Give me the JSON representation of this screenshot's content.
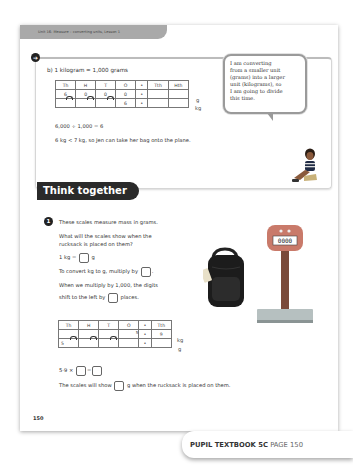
{
  "header": {
    "unit_label": "Unit 16: Measure – converting units, Lesson 1"
  },
  "part_b": {
    "icon": "arrow-icon",
    "title": "b)  1 kilogram = 1,000 grams",
    "table": {
      "headers": [
        "Th",
        "H",
        "T",
        "O",
        "•",
        "Tth",
        "Hth"
      ],
      "rows": [
        {
          "cells": [
            "6",
            "0",
            "0",
            "0",
            "•",
            "",
            ""
          ],
          "unit": "g"
        },
        {
          "cells": [
            "",
            "",
            "",
            "6",
            "•",
            "",
            ""
          ],
          "unit": "kg"
        }
      ]
    },
    "equation": "6,000 ÷ 1,000 = 6",
    "conclusion": "6 kg < 7 kg, so Jen can take her bag onto the plane."
  },
  "speech_bubble": {
    "lines": [
      "I am converting",
      "from a smaller unit",
      "(grams) into a larger",
      "unit (kilograms), so",
      "I am going to divide",
      "this time."
    ]
  },
  "think_together": {
    "heading": "Think together",
    "question_number": "1",
    "intro": "These scales measure mass in grams.",
    "question_line1": "What will the scales show when the",
    "question_line2": "rucksack is placed on them?",
    "kg_prefix": "1 kg =",
    "kg_suffix": "g",
    "convert_prefix": "To convert kg to g, multiply by",
    "convert_suffix": ".",
    "multiply_line1": "When we multiply by 1,000, the digits",
    "multiply_prefix": "shift to the left by",
    "multiply_suffix": "places.",
    "table": {
      "headers": [
        "Th",
        "H",
        "T",
        "O",
        "•",
        "Tth"
      ],
      "rows": [
        {
          "cells": [
            "",
            "",
            "",
            "5",
            "•",
            "9"
          ],
          "unit": "kg"
        },
        {
          "cells": [
            "5",
            "",
            "",
            "",
            "•",
            ""
          ],
          "unit": "g"
        }
      ]
    },
    "calc_prefix": "5·9 ×",
    "calc_equals": "=",
    "answer_prefix": "The scales will show",
    "answer_suffix": "g when the rucksack is placed on them.",
    "scale_display": "0000"
  },
  "footer": {
    "page_number": "150",
    "book_label": "PUPIL TEXTBOOK 5C",
    "page_label": "PAGE 150"
  }
}
